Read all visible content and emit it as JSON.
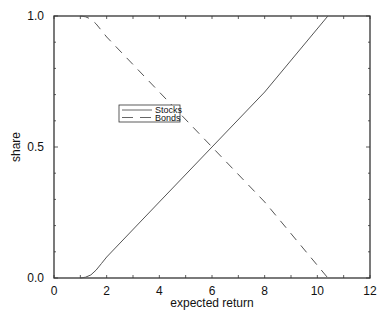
{
  "chart_data": {
    "type": "line",
    "title": "",
    "xlabel": "expected return",
    "ylabel": "share",
    "xlim": [
      0,
      12
    ],
    "ylim": [
      0,
      1
    ],
    "xticks": [
      0,
      2,
      4,
      6,
      8,
      10,
      12
    ],
    "xtick_labels": [
      "0",
      "2",
      "4",
      "6",
      "8",
      "10",
      "12"
    ],
    "yticks": [
      0,
      0.5,
      1
    ],
    "ytick_labels": [
      "0.0",
      "0.5",
      "1.0"
    ],
    "grid": false,
    "legend_position": "upper-left-center",
    "series": [
      {
        "name": "Stocks",
        "style": "solid",
        "x": [
          1.0,
          1.2,
          1.4,
          1.6,
          1.8,
          2.0,
          4.0,
          6.0,
          8.0,
          10.4
        ],
        "y": [
          0.0,
          0.003,
          0.012,
          0.03,
          0.055,
          0.08,
          0.29,
          0.5,
          0.71,
          1.0
        ]
      },
      {
        "name": "Bonds",
        "style": "dashed",
        "x": [
          1.0,
          1.2,
          1.4,
          1.6,
          1.8,
          2.0,
          4.0,
          6.0,
          8.0,
          10.4
        ],
        "y": [
          1.0,
          0.997,
          0.988,
          0.97,
          0.945,
          0.92,
          0.71,
          0.5,
          0.29,
          0.0
        ]
      }
    ]
  },
  "legend": {
    "items": [
      {
        "label": "Stocks",
        "style": "solid"
      },
      {
        "label": "Bonds",
        "style": "dashed"
      }
    ]
  },
  "colors": {
    "line": "#555555",
    "axis": "#333333"
  }
}
